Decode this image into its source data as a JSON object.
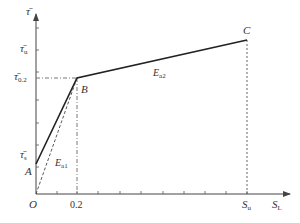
{
  "diagram": {
    "type": "piecewise-linear stress-slip curve",
    "y_axis_label": "τ̄",
    "x_axis_label": {
      "main": "S",
      "sub": "L"
    },
    "y_ticks": [
      {
        "main": "τ̄",
        "sub": "u"
      },
      {
        "main": "τ̄",
        "sub": "0.2"
      },
      {
        "main": "τ̄",
        "sub": "s"
      }
    ],
    "x_ticks": [
      {
        "text": "0.2"
      },
      {
        "main": "S",
        "sub": "u"
      }
    ],
    "origin_label": "O",
    "points": {
      "A": "A",
      "B": "B",
      "C": "C"
    },
    "segments": [
      {
        "name": "E",
        "sub": "a1",
        "style": "dashed",
        "from": "O",
        "to": "B"
      },
      {
        "name": "E",
        "sub": "a2",
        "style": "solid",
        "from": "B",
        "to": "C"
      }
    ],
    "colors": {
      "line": "#222222",
      "axis": "#444444",
      "text": "#333333"
    }
  }
}
